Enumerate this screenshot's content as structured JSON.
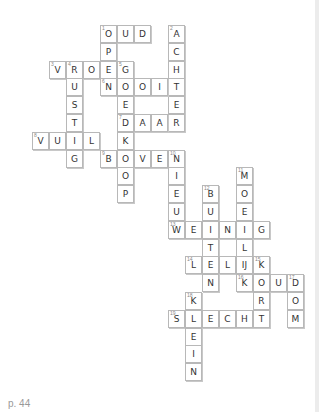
{
  "page_label": "p. 44",
  "grid": {
    "origin_x": 32,
    "origin_y": 25,
    "cell_w": 17,
    "cell_h": 17.8
  },
  "cells": [
    {
      "r": 0,
      "c": 4,
      "l": "O",
      "n": "1"
    },
    {
      "r": 0,
      "c": 5,
      "l": "U"
    },
    {
      "r": 0,
      "c": 6,
      "l": "D"
    },
    {
      "r": 0,
      "c": 8,
      "l": "A",
      "n": "2"
    },
    {
      "r": 1,
      "c": 8,
      "l": "C"
    },
    {
      "r": 2,
      "c": 8,
      "l": "H"
    },
    {
      "r": 3,
      "c": 8,
      "l": "T"
    },
    {
      "r": 4,
      "c": 8,
      "l": "E"
    },
    {
      "r": 5,
      "c": 8,
      "l": "R"
    },
    {
      "r": 1,
      "c": 4,
      "l": "P"
    },
    {
      "r": 2,
      "c": 1,
      "l": "V",
      "n": "3"
    },
    {
      "r": 2,
      "c": 2,
      "l": "R",
      "n": "4"
    },
    {
      "r": 2,
      "c": 3,
      "l": "O"
    },
    {
      "r": 2,
      "c": 4,
      "l": "E"
    },
    {
      "r": 2,
      "c": 5,
      "l": "G",
      "n": "5"
    },
    {
      "r": 3,
      "c": 2,
      "l": "U"
    },
    {
      "r": 3,
      "c": 4,
      "l": "N",
      "n": "6"
    },
    {
      "r": 3,
      "c": 5,
      "l": "O"
    },
    {
      "r": 3,
      "c": 6,
      "l": "O"
    },
    {
      "r": 3,
      "c": 7,
      "l": "I"
    },
    {
      "r": 4,
      "c": 2,
      "l": "S"
    },
    {
      "r": 4,
      "c": 5,
      "l": "E"
    },
    {
      "r": 5,
      "c": 2,
      "l": "T"
    },
    {
      "r": 5,
      "c": 5,
      "l": "D",
      "n": "7"
    },
    {
      "r": 5,
      "c": 6,
      "l": "A"
    },
    {
      "r": 5,
      "c": 7,
      "l": "A"
    },
    {
      "r": 6,
      "c": 0,
      "l": "V",
      "n": "8"
    },
    {
      "r": 6,
      "c": 1,
      "l": "U"
    },
    {
      "r": 6,
      "c": 2,
      "l": "I"
    },
    {
      "r": 6,
      "c": 3,
      "l": "L"
    },
    {
      "r": 6,
      "c": 5,
      "l": "K"
    },
    {
      "r": 7,
      "c": 2,
      "l": "G"
    },
    {
      "r": 7,
      "c": 4,
      "l": "B",
      "n": "9"
    },
    {
      "r": 7,
      "c": 5,
      "l": "O"
    },
    {
      "r": 7,
      "c": 6,
      "l": "V"
    },
    {
      "r": 7,
      "c": 7,
      "l": "E"
    },
    {
      "r": 7,
      "c": 8,
      "l": "N",
      "n": "10"
    },
    {
      "r": 8,
      "c": 5,
      "l": "O"
    },
    {
      "r": 8,
      "c": 8,
      "l": "I"
    },
    {
      "r": 8,
      "c": 12,
      "l": "M",
      "n": "11"
    },
    {
      "r": 9,
      "c": 5,
      "l": "P"
    },
    {
      "r": 9,
      "c": 8,
      "l": "E"
    },
    {
      "r": 9,
      "c": 10,
      "l": "B",
      "n": "12"
    },
    {
      "r": 9,
      "c": 12,
      "l": "O"
    },
    {
      "r": 10,
      "c": 8,
      "l": "U"
    },
    {
      "r": 10,
      "c": 10,
      "l": "U"
    },
    {
      "r": 10,
      "c": 12,
      "l": "E"
    },
    {
      "r": 11,
      "c": 8,
      "l": "W",
      "n": "13"
    },
    {
      "r": 11,
      "c": 9,
      "l": "E"
    },
    {
      "r": 11,
      "c": 10,
      "l": "I"
    },
    {
      "r": 11,
      "c": 11,
      "l": "N"
    },
    {
      "r": 11,
      "c": 12,
      "l": "I"
    },
    {
      "r": 11,
      "c": 13,
      "l": "G"
    },
    {
      "r": 12,
      "c": 10,
      "l": "T"
    },
    {
      "r": 12,
      "c": 12,
      "l": "L"
    },
    {
      "r": 13,
      "c": 9,
      "l": "L",
      "n": "14"
    },
    {
      "r": 13,
      "c": 10,
      "l": "E"
    },
    {
      "r": 13,
      "c": 11,
      "l": "L"
    },
    {
      "r": 13,
      "c": 12,
      "l": "IJ"
    },
    {
      "r": 13,
      "c": 13,
      "l": "K",
      "n": "15"
    },
    {
      "r": 14,
      "c": 10,
      "l": "N"
    },
    {
      "r": 14,
      "c": 12,
      "l": "K",
      "n": "16"
    },
    {
      "r": 14,
      "c": 13,
      "l": "O"
    },
    {
      "r": 14,
      "c": 14,
      "l": "U"
    },
    {
      "r": 14,
      "c": 15,
      "l": "D",
      "n": "17"
    },
    {
      "r": 15,
      "c": 9,
      "l": "K",
      "n": "18"
    },
    {
      "r": 15,
      "c": 13,
      "l": "R"
    },
    {
      "r": 15,
      "c": 15,
      "l": "O"
    },
    {
      "r": 16,
      "c": 8,
      "l": "S",
      "n": "19"
    },
    {
      "r": 16,
      "c": 9,
      "l": "L"
    },
    {
      "r": 16,
      "c": 10,
      "l": "E"
    },
    {
      "r": 16,
      "c": 11,
      "l": "C"
    },
    {
      "r": 16,
      "c": 12,
      "l": "H"
    },
    {
      "r": 16,
      "c": 13,
      "l": "T"
    },
    {
      "r": 16,
      "c": 15,
      "l": "M"
    },
    {
      "r": 17,
      "c": 9,
      "l": "E"
    },
    {
      "r": 18,
      "c": 9,
      "l": "I"
    },
    {
      "r": 19,
      "c": 9,
      "l": "N"
    }
  ]
}
